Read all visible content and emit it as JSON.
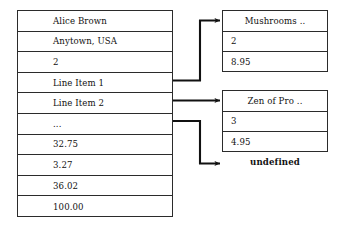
{
  "diagram": {
    "type": "object-reference-diagram",
    "main_record": {
      "name": "main-record",
      "rows": [
        {
          "label": "Alice Brown"
        },
        {
          "label": "Anytown, USA"
        },
        {
          "label": "2"
        },
        {
          "label": "Line Item 1"
        },
        {
          "label": "Line Item 2"
        },
        {
          "label": "..."
        },
        {
          "label": "32.75"
        },
        {
          "label": "3.27"
        },
        {
          "label": "36.02"
        },
        {
          "label": "100.00"
        }
      ]
    },
    "detail_boxes": [
      {
        "name": "line-item-1-detail",
        "header": "Mushrooms ..",
        "rows": [
          {
            "value": "2"
          },
          {
            "value": "8.95"
          }
        ]
      },
      {
        "name": "line-item-2-detail",
        "header": "Zen of Pro ..",
        "rows": [
          {
            "value": "3"
          },
          {
            "value": "4.95"
          }
        ]
      }
    ],
    "undefined_label": "undefined",
    "connectors": [
      {
        "name": "connector-line-item-1",
        "from_row": "Line Item 1",
        "to": "Mushrooms .."
      },
      {
        "name": "connector-line-item-2",
        "from_row": "Line Item 2",
        "to": "Zen of Pro .."
      },
      {
        "name": "connector-ellipsis",
        "from_row": "...",
        "to": "undefined"
      }
    ],
    "colors": {
      "stroke": "#2b2b2b",
      "connector": "#111111",
      "background": "#ffffff",
      "text": "#111111"
    }
  }
}
